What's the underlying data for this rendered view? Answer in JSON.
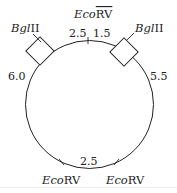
{
  "diagram": {
    "type": "plasmid-restriction-map",
    "enzymes": {
      "bglII_left": {
        "name_italic": "Bgl",
        "name_roman": "II"
      },
      "bglII_right": {
        "name_italic": "Bgl",
        "name_roman": "II"
      },
      "ecoRV_top": {
        "name_italic": "Eco",
        "name_roman": "RV"
      },
      "ecoRV_bottom_left": {
        "name_italic": "Eco",
        "name_roman": "RV"
      },
      "ecoRV_bottom_right": {
        "name_italic": "Eco",
        "name_roman": "RV"
      }
    },
    "segments": {
      "top_left": "2.5",
      "top_right": "1.5",
      "left": "6.0",
      "right": "5.5",
      "bottom": "2.5"
    },
    "colors": {
      "line": "#222222",
      "background": "#ffffff"
    }
  }
}
